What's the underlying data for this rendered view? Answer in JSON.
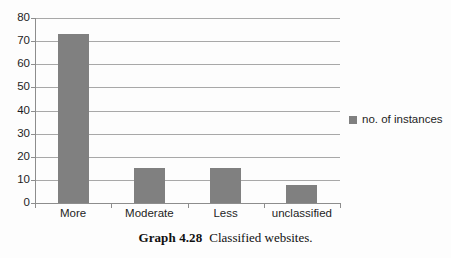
{
  "chart_data": {
    "type": "bar",
    "title": "",
    "subtitle": "",
    "xlabel": "",
    "ylabel": "",
    "categories": [
      "More",
      "Moderate",
      "Less",
      "unclassified"
    ],
    "series": [
      {
        "name": "no. of instances",
        "values": [
          73,
          15,
          15,
          8
        ],
        "color": "#808080"
      }
    ],
    "ylim": [
      0,
      80
    ],
    "yticks": [
      0,
      10,
      20,
      30,
      40,
      50,
      60,
      70,
      80
    ],
    "ytick_labels": [
      "0",
      "10",
      "20",
      "30",
      "40",
      "50",
      "60",
      "70",
      "80"
    ],
    "grid": true,
    "grid_axis": "y",
    "legend": {
      "position": "right",
      "entries": [
        {
          "label": "no. of instances",
          "color": "#808080"
        }
      ]
    },
    "annotations": []
  },
  "caption": {
    "label": "Graph 4.28",
    "text": "Classified websites."
  },
  "colors": {
    "bar": "#808080",
    "gridline": "#a8a8a8",
    "axis": "#8d8d8d",
    "text": "#1d1d1d",
    "background": "#fdfdfd"
  }
}
